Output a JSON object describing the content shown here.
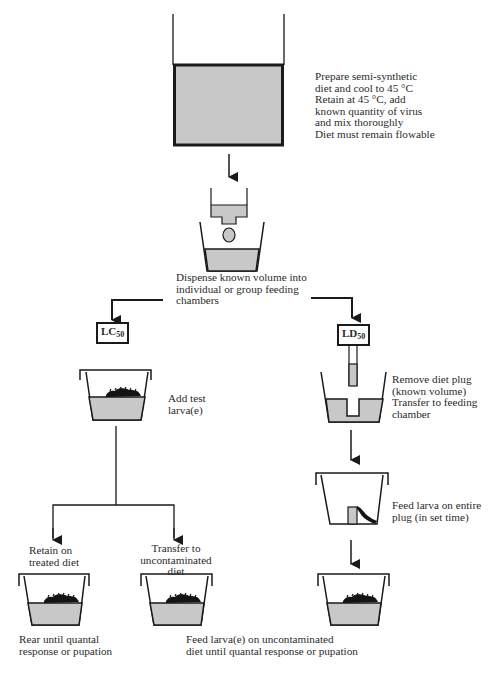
{
  "diagram": {
    "type": "flowchart",
    "colors": {
      "diet_fill": "#c8c8c8",
      "line": "#1a1a1a",
      "larva": "#141414",
      "background": "#ffffff"
    },
    "steps": {
      "prepare": {
        "text": "Prepare semi-synthetic\ndiet and cool to 45 °C\nRetain at 45 °C, add\nknown quantity of virus\nand mix thoroughly\nDiet must remain flowable"
      },
      "dispense": {
        "text": "Dispense known volume into\nindividual or group feeding\nchambers"
      },
      "lc50": {
        "label_main": "LC",
        "label_sub": "50",
        "add_larvae": "Add test\nlarva(e)",
        "branch_retain": "Retain on\ntreated diet",
        "branch_transfer": "Transfer to\nuncontaminated\ndiet",
        "rear": "Rear until quantal\nresponse or pupation"
      },
      "ld50": {
        "label_main": "LD",
        "label_sub": "50",
        "remove_plug": "Remove diet plug\n(known volume)\nTransfer to feeding\nchamber",
        "feed_plug": "Feed larva on entire\nplug (in set time)"
      },
      "final": {
        "text": "Feed larva(e) on uncontaminated\ndiet until quantal response or pupation"
      }
    },
    "edges": [
      [
        "prepare",
        "dispense"
      ],
      [
        "dispense",
        "lc50"
      ],
      [
        "dispense",
        "ld50"
      ],
      [
        "lc50",
        "add_larvae"
      ],
      [
        "add_larvae",
        "branch_retain"
      ],
      [
        "add_larvae",
        "branch_transfer"
      ],
      [
        "ld50",
        "remove_plug"
      ],
      [
        "remove_plug",
        "feed_plug"
      ],
      [
        "feed_plug",
        "final"
      ]
    ]
  }
}
